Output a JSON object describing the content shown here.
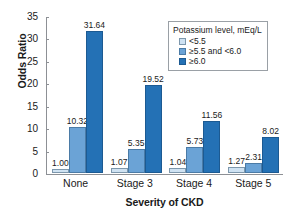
{
  "chart_data": {
    "type": "bar",
    "title": "",
    "xlabel": "Severity of CKD",
    "ylabel": "Odds Ratio",
    "ylim": [
      0,
      35
    ],
    "yticks": [
      0,
      5,
      10,
      15,
      20,
      25,
      30,
      35
    ],
    "grid": false,
    "legend_position": "top-right",
    "legend_title": "Potassium level, mEq/L",
    "categories": [
      "None",
      "Stage 3",
      "Stage 4",
      "Stage 5"
    ],
    "series": [
      {
        "name": "<5.5",
        "color": "#cfe2f2",
        "values": [
          1.0,
          1.07,
          1.04,
          1.27
        ],
        "labels": [
          "1.00",
          "1.07",
          "1.04",
          "1.27"
        ]
      },
      {
        "name": "≥5.5 and <6.0",
        "color": "#6ba3d6",
        "values": [
          10.32,
          5.35,
          5.73,
          2.31
        ],
        "labels": [
          "10.32",
          "5.35",
          "5.73",
          "2.31"
        ]
      },
      {
        "name": "≥6.0",
        "color": "#2471b5",
        "values": [
          31.64,
          19.52,
          11.56,
          8.02
        ],
        "labels": [
          "31.64",
          "19.52",
          "11.56",
          "8.02"
        ]
      }
    ]
  },
  "axes": {
    "y_title": "Odds Ratio",
    "x_title": "Severity of CKD",
    "y_tick_labels": [
      "35",
      "30",
      "25",
      "20",
      "15",
      "10",
      "5",
      "0"
    ],
    "x_tick_labels": [
      "None",
      "Stage 3",
      "Stage 4",
      "Stage 5"
    ]
  },
  "legend": {
    "title": "Potassium level, mEq/L",
    "items": [
      {
        "label": "<5.5"
      },
      {
        "label": "≥5.5 and <6.0"
      },
      {
        "label": "≥6.0"
      }
    ]
  }
}
